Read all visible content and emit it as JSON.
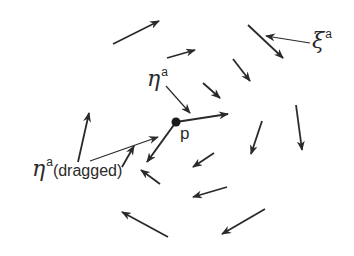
{
  "diagram": {
    "colors": {
      "stroke": "#2a2a2a",
      "background": "#ffffff"
    },
    "point": {
      "label": "p",
      "x": 176,
      "y": 122
    },
    "labels": {
      "xi": {
        "symbol": "ξ",
        "superscript": "a"
      },
      "eta": {
        "symbol": "η",
        "superscript": "a"
      },
      "eta_dragged": {
        "symbol": "η",
        "superscript": "a",
        "suffix": "(dragged)"
      },
      "p": "p"
    },
    "field_arrows": [
      {
        "x1": 113,
        "y1": 44,
        "x2": 159,
        "y2": 21
      },
      {
        "x1": 167,
        "y1": 58,
        "x2": 195,
        "y2": 50
      },
      {
        "x1": 248,
        "y1": 25,
        "x2": 283,
        "y2": 58
      },
      {
        "x1": 233,
        "y1": 59,
        "x2": 250,
        "y2": 81
      },
      {
        "x1": 203,
        "y1": 83,
        "x2": 220,
        "y2": 98
      },
      {
        "x1": 78,
        "y1": 162,
        "x2": 89,
        "y2": 113
      },
      {
        "x1": 122,
        "y1": 167,
        "x2": 134,
        "y2": 146
      },
      {
        "x1": 262,
        "y1": 121,
        "x2": 251,
        "y2": 154
      },
      {
        "x1": 296,
        "y1": 105,
        "x2": 302,
        "y2": 150
      },
      {
        "x1": 214,
        "y1": 153,
        "x2": 193,
        "y2": 167
      },
      {
        "x1": 227,
        "y1": 187,
        "x2": 193,
        "y2": 197
      },
      {
        "x1": 160,
        "y1": 184,
        "x2": 141,
        "y2": 170
      },
      {
        "x1": 265,
        "y1": 209,
        "x2": 222,
        "y2": 234
      },
      {
        "x1": 168,
        "y1": 237,
        "x2": 122,
        "y2": 212
      }
    ],
    "eta_vector": {
      "x1": 176,
      "y1": 122,
      "x2": 228,
      "y2": 114
    },
    "eta_dragged_vector": {
      "x1": 176,
      "y1": 122,
      "x2": 147,
      "y2": 162
    },
    "leaders": {
      "xi": {
        "x1": 310,
        "y1": 43,
        "x2": 266,
        "y2": 36
      },
      "eta": {
        "x1": 166,
        "y1": 86,
        "x2": 190,
        "y2": 113
      },
      "eta_dragged": {
        "x1": 90,
        "y1": 161,
        "x2": 158,
        "y2": 137
      }
    }
  }
}
